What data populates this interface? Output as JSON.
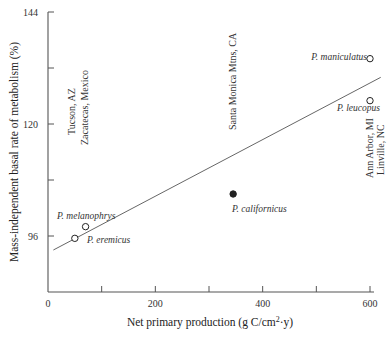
{
  "chart_data": {
    "type": "scatter",
    "title": "",
    "xlabel": "Net primary production (g C/cm2·y)",
    "xlabel_parts": {
      "pre": "Net primary production (g C/cm",
      "sup": "2",
      "post": "·y)"
    },
    "ylabel": "Mass-independent basal rate of metabolism (%)",
    "xlim": [
      0,
      600
    ],
    "ylim": [
      84,
      144
    ],
    "x_ticks": [
      0,
      100,
      200,
      300,
      400,
      500,
      600
    ],
    "x_tick_labels": [
      "0",
      "200",
      "400",
      "600"
    ],
    "x_tick_label_values": [
      0,
      200,
      400,
      600
    ],
    "y_ticks": [
      96,
      108,
      120,
      132,
      144
    ],
    "y_tick_labels": [
      "96",
      "120",
      "144"
    ],
    "y_tick_label_values": [
      96,
      120,
      144
    ],
    "grid": false,
    "legend": null,
    "points": [
      {
        "label": "P. melanophrys",
        "x": 70,
        "y": 98,
        "marker": "open-circle"
      },
      {
        "label": "P. eremicus",
        "x": 50,
        "y": 95.5,
        "marker": "open-circle"
      },
      {
        "label": "P. californicus",
        "x": 345,
        "y": 105,
        "marker": "filled-circle"
      },
      {
        "label": "P. maniculatus",
        "x": 600,
        "y": 134,
        "marker": "open-circle"
      },
      {
        "label": "P. leucopus",
        "x": 600,
        "y": 125,
        "marker": "open-circle"
      }
    ],
    "regression_line": {
      "x": [
        10,
        620
      ],
      "y": [
        93,
        130
      ]
    },
    "annotations": [
      {
        "text": "Tucson, AZ",
        "orientation": "vertical"
      },
      {
        "text": "Zacatecas, Mexico",
        "orientation": "vertical"
      },
      {
        "text": "Santa Monica Mtns, CA",
        "orientation": "vertical"
      },
      {
        "text": "Ann Arbor, MI",
        "orientation": "vertical"
      },
      {
        "text": "Linville, NC",
        "orientation": "vertical"
      }
    ]
  },
  "colors": {
    "axis": "#555555",
    "marker": "#222222",
    "line": "#555555",
    "text": "#333333"
  }
}
